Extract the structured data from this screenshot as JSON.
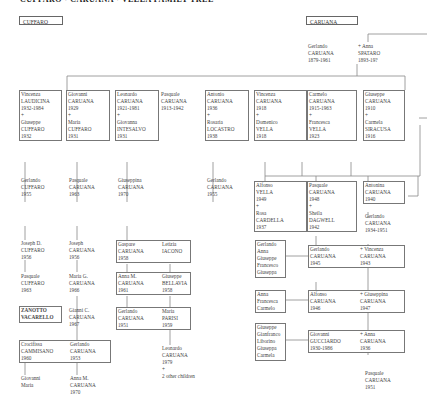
{
  "header": {
    "title": "CUFFARO · CARUANA · VELLA FAMILY TREE"
  },
  "families": {
    "cuffaro": "CUFFARO",
    "caruana": "CARUANA"
  },
  "root": {
    "husband": "Gerlando\nCARUANA\n1879-1961",
    "wife": "+ Anna\nSPATARO\n1893-19?"
  },
  "gen1": [
    {
      "id": "vincenza-laudicina",
      "text": "Vincenza\nLAUDICINA\n1932-1984\n+\nGiuseppe\nCUFFARO\n1932"
    },
    {
      "id": "giovanni-caruana",
      "text": "Giovanni\nCARUANA\n1929\n+\nMaria\nCUFFARO\n1931"
    },
    {
      "id": "leonardo-caruana",
      "text": "Leonardo\nCARUANA\n1921-1981\n+\nGiovanna\nINTESALVO\n1931"
    },
    {
      "id": "pasquale-caruana",
      "text": "Pasquale\nCARUANA\n1913-1942"
    },
    {
      "id": "antonio-caruana",
      "text": "Antonio\nCARUANA\n1936\n+\nRosaria\nLOCASTRO\n1938"
    },
    {
      "id": "vincenza-caruana",
      "text": "Vincenza\nCARUANA\n1918\n+\nDomenico\nVELLA\n1918"
    },
    {
      "id": "carmelo-caruana",
      "text": "Carmelo\nCARUANA\n1915-1963\n+\nFrancesca\nVELLA\n1923"
    },
    {
      "id": "giuseppe-caruana",
      "text": "Giuseppe\nCARUANA\n1910\n+\nCarmela\nSIRACUSA\n1916"
    }
  ],
  "gen2": {
    "gerlando_cuffaro": "Gerlando\nCUFFARO\n1955",
    "pasquale_caruana_63": "Pasquale\nCARUANA\n1963",
    "giuseppina_caruana": "Giuseppina\nCARUANA\n1970",
    "gerlando_caruana_55": "Gerlando\nCARUANA\n1955",
    "alfonso_vella": "Alfonso\nVELLA\n1949\n+\nRosa\nCARDELLA\n1937",
    "pasquale_caruana_48": "Pasquale\nCARUANA\n1948\n+\nSheila\nDAGWELL\n1942",
    "antonina_caruana": "Antonina\nCARUANA\n1940",
    "gerlando_caruana_34": "Gerlando\nCARUANA\n1934-1951"
  },
  "gen3": {
    "joseph_d_cuffaro": "Joseph D.\nCUFFARO\n1956",
    "joseph_caruana": "Joseph\nCARUANA\n1956",
    "gaspare": "Gaspare\nCARUANA\n1958",
    "letizia": "Letizia\nIACONO",
    "pasquale_cuffaro": "Pasquale\nCUFFARO\n1963",
    "maria_g": "Maria G.\nCARUANA\n1966",
    "anna_m_61": "Anna M.\nCARUANA\n1961",
    "giuseppe_bellavia": "Giuseppe\nBELLAVIA\n1958",
    "zanotto": "ZANOTTO\nVACARELLO",
    "gianni_c": "Gianni C.\nCARUANA\n1967",
    "gerlando_51": "Gerlando\nCARUANA\n1951",
    "maria_parisi": "Maria\nPARISI\n1959",
    "crocifissa": "Crocifissa\nCAMMISANO\n1960",
    "gerlando_53": "Gerlando\nCARUANA\n1953",
    "leonardo_79": "Leonardo\nCARUANA\n1979\n+\n2 other children",
    "giovanni_maria": "Giovanni\nMaria",
    "anna_m_70": "Anna M.\nCARUANA\n1970"
  },
  "right_branch": {
    "kids1": "Gerlando\nAnna\nGiuseppe\nFrancesco\nGiuseppa",
    "gerlando_45": "Gerlando\nCARUANA\n1945",
    "vincenza_45": "+ Vincenza\nCARUANA\n1943",
    "kids2": "Anna\nFrancesca\nCarmelo",
    "alfonso_46": "Alfonso\nCARUANA\n1946",
    "giuseppina_47": "+ Giuseppina\nCARUANA\n1947",
    "kids3": "Giuseppe\nGianfranco\nLiborino\nGiuseppa\nCarmela",
    "giovanni_gucciardo": "Giovanni\nGUCCIARDO\n1930-1986",
    "anna_36": "+ Anna\nCARUANA\n1936",
    "pasquale_51": "Pasquale\nCARUANA\n1951"
  }
}
